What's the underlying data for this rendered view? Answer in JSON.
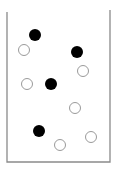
{
  "diagram": {
    "container": {
      "left_x": 7,
      "right_x": 110,
      "top_left_y": 12,
      "top_right_y": 10,
      "bottom_y": 162,
      "stroke": "#8a8a8a"
    },
    "particle_radius": 6,
    "colors": {
      "filled": "#000000",
      "hollow_fill": "#ffffff",
      "hollow_stroke": "#9a9a9a"
    },
    "particles": [
      {
        "type": "filled",
        "x": 35,
        "y": 35
      },
      {
        "type": "hollow",
        "x": 24,
        "y": 50
      },
      {
        "type": "filled",
        "x": 77,
        "y": 52
      },
      {
        "type": "hollow",
        "x": 83,
        "y": 71
      },
      {
        "type": "hollow",
        "x": 27,
        "y": 84
      },
      {
        "type": "filled",
        "x": 51,
        "y": 84
      },
      {
        "type": "hollow",
        "x": 75,
        "y": 108
      },
      {
        "type": "filled",
        "x": 39,
        "y": 131
      },
      {
        "type": "hollow",
        "x": 91,
        "y": 137
      },
      {
        "type": "hollow",
        "x": 60,
        "y": 145
      }
    ],
    "counts": {
      "filled": 4,
      "hollow": 6
    }
  }
}
